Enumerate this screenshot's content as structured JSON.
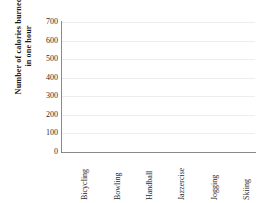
{
  "chart_data": {
    "type": "bar",
    "title": "",
    "xlabel": "",
    "ylabel": "Number of calories burned\nin one hour",
    "categories": [
      "Bicycling",
      "Bowling",
      "Handball",
      "Jazzercise",
      "Jogging",
      "Skiing"
    ],
    "values": [
      null,
      null,
      null,
      null,
      null,
      null
    ],
    "series": [
      {
        "name": "Calories burned",
        "values": [
          null,
          null,
          null,
          null,
          null,
          null
        ]
      }
    ],
    "yticks": [
      0,
      100,
      200,
      300,
      400,
      500,
      600,
      700
    ],
    "ytick_labels": [
      "0",
      "100",
      "200",
      "300",
      "400",
      "500",
      "600",
      "700"
    ],
    "ylim": [
      0,
      700
    ],
    "grid": true,
    "grid_axis": "y",
    "legend": false,
    "legend_position": "none",
    "note": "Empty axes template - no bars plotted",
    "colors": {
      "background": "#ffffff",
      "gridline": "#ededed",
      "axis": "#8a8a8a",
      "text": "#2b2b2b",
      "title_text": "#1a1a1a"
    }
  }
}
